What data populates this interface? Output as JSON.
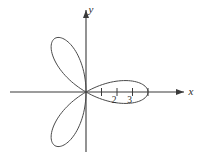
{
  "figure": {
    "kind": "polar-rose-plot",
    "background_color": "#ffffff",
    "line_color": "#4a4a4a",
    "axis_color": "#3a3a3a",
    "text_color": "#2b2b2b"
  },
  "axes": {
    "x_label": "x",
    "y_label": "y",
    "origin_px": [
      86,
      92
    ],
    "unit_px": 15.5,
    "x_axis_span_px": [
      10,
      184
    ],
    "y_axis_span_px": [
      10,
      152
    ],
    "x_arrow": true,
    "y_arrow": true,
    "grid": false
  },
  "ticks": {
    "x_values": [
      1,
      2,
      3,
      4
    ],
    "x_labels": [
      "",
      "2",
      "3",
      ""
    ],
    "visible_label_values": [
      2,
      3
    ],
    "tick_length_px": 7
  },
  "chart_data": {
    "type": "line",
    "title": "",
    "subtitle": "",
    "xlabel": "x",
    "ylabel": "y",
    "legend": [],
    "grid": false,
    "coordinate_system": "polar",
    "equation": "r = 4 cos(3θ)",
    "amplitude": 4,
    "petal_count": 3,
    "petal_angles_deg": [
      0,
      120,
      240
    ],
    "xlim": [
      -5,
      6.4
    ],
    "ylim": [
      -4.5,
      5.3
    ],
    "annotations": [
      {
        "text": "2",
        "x": 2,
        "y": -0.55
      },
      {
        "text": "3",
        "x": 3,
        "y": -0.55
      },
      {
        "text": "x",
        "x": 6.2,
        "y": 0.35
      },
      {
        "text": "y",
        "x": 0.45,
        "y": 5.1
      }
    ],
    "series": [
      {
        "name": "r = 4 cos(3θ)",
        "color": "#4a4a4a",
        "theta_deg": [
          -30,
          -24,
          -18,
          -12,
          -6,
          0,
          6,
          12,
          18,
          24,
          30,
          90,
          96,
          102,
          108,
          114,
          120,
          126,
          132,
          138,
          144,
          150,
          210,
          216,
          222,
          228,
          234,
          240,
          246,
          252,
          258,
          264,
          270
        ],
        "r": [
          0,
          1.25,
          2.35,
          3.24,
          3.81,
          4,
          3.81,
          3.24,
          2.35,
          1.25,
          0,
          0,
          -1.25,
          -2.35,
          -3.24,
          -3.81,
          -4,
          -3.81,
          -3.24,
          -2.35,
          -1.25,
          0,
          0,
          1.25,
          2.35,
          3.24,
          3.81,
          4,
          3.81,
          3.24,
          2.35,
          1.25,
          0
        ]
      }
    ]
  }
}
